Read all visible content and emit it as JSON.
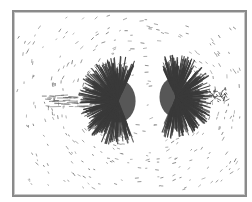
{
  "image": {
    "subject": "iron filings magnetic field pattern",
    "description": "Photograph of iron filings aligned along magnetic field lines between two poles, framed by a gray border",
    "colors": {
      "background": "#ffffff",
      "frame": "#8a8a8a",
      "filings_dense": "#3a3a3a",
      "filings_sparse": "#6a6a6a"
    },
    "regions": [
      {
        "name": "left-pole-cluster",
        "center": [
          115,
          100
        ]
      },
      {
        "name": "right-pole-cluster",
        "center": [
          178,
          97
        ]
      },
      {
        "name": "left-streak",
        "center": [
          60,
          100
        ]
      },
      {
        "name": "right-small-cluster",
        "center": [
          218,
          95
        ]
      }
    ]
  }
}
